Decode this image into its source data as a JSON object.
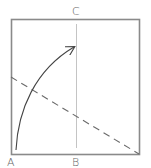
{
  "diagram": {
    "type": "folding-diagram",
    "labels": {
      "top_center": "C",
      "bottom_left": "A",
      "bottom_center": "B"
    },
    "colors": {
      "outline": "#888888",
      "center_line": "#bbbbbb",
      "dashed_fold": "#666666",
      "arrow": "#444444",
      "label": "#666666"
    },
    "elements": [
      {
        "kind": "square",
        "desc": "paper outline"
      },
      {
        "kind": "line",
        "desc": "vertical center crease"
      },
      {
        "kind": "dashed-line",
        "desc": "valley fold line from left edge to bottom-right corner"
      },
      {
        "kind": "arrow",
        "desc": "curved arrow bringing corner A to center crease"
      }
    ]
  }
}
